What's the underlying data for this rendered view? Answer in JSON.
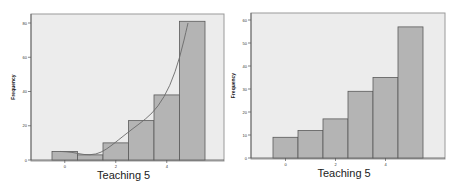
{
  "chart_data": [
    {
      "type": "bar",
      "subtype": "histogram_with_curve",
      "title": "",
      "xlabel": "Teaching 5",
      "ylabel": "Frequency",
      "categories": [
        "0",
        "1",
        "2",
        "3",
        "4",
        "5"
      ],
      "values": [
        5,
        3,
        10,
        23,
        38,
        81
      ],
      "x_ticks": [
        "0",
        "2",
        "4"
      ],
      "y_ticks": [
        "0",
        "20",
        "40",
        "60",
        "80"
      ],
      "ylim": [
        0,
        85
      ],
      "curve": "smoothed fit line overlay",
      "grid": false,
      "legend": null
    },
    {
      "type": "bar",
      "subtype": "histogram",
      "title": "",
      "xlabel": "Teaching 5",
      "ylabel": "Frequency",
      "categories": [
        "0",
        "1",
        "2",
        "3",
        "4",
        "5"
      ],
      "values": [
        9,
        12,
        17,
        29,
        35,
        57
      ],
      "x_ticks": [
        "0",
        "2",
        "4"
      ],
      "y_ticks": [
        "0",
        "10",
        "20",
        "30",
        "40",
        "50",
        "60"
      ],
      "ylim": [
        0,
        63
      ],
      "grid": false,
      "legend": null
    }
  ],
  "colors": {
    "plot_bg": "#ececec",
    "bar_fill": "#b4b4b4",
    "bar_stroke": "#5a5a5a",
    "curve": "#6a6a6a",
    "frame": "#9a9a9a"
  }
}
